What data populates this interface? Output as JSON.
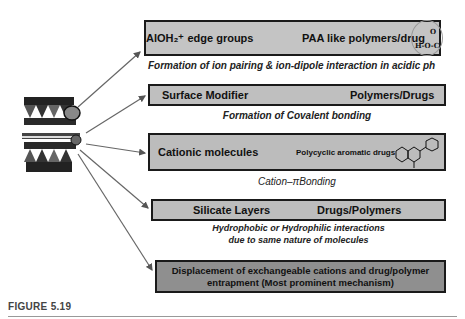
{
  "figure_label": "FIGURE 5.19",
  "clay_structure": {
    "icon": "clay-layer-structure-icon"
  },
  "mechanisms": [
    {
      "left": "AlOH₂⁺ edge groups",
      "right": "PAA like polymers/drug",
      "icon": "carboxylic-acid-group-icon",
      "icon_text": "H-O-C",
      "icon_o": "O",
      "caption": "Formation of ion pairing & ion-dipole interaction in acidic ph"
    },
    {
      "left": "Surface Modifier",
      "right": "Polymers/Drugs",
      "caption": "Formation of Covalent bonding"
    },
    {
      "left": "Cationic molecules",
      "right": "Polycyclic aromatic drugs",
      "icon": "polycyclic-aromatic-structure-icon",
      "caption": "Cation–πBonding"
    },
    {
      "left": "Silicate Layers",
      "right": "Drugs/Polymers",
      "caption_line1": "Hydrophobic  or Hydrophilic interactions",
      "caption_line2": "due to same nature of molecules"
    },
    {
      "line1": "Displacement of exchangeable cations and drug/polymer",
      "line2": "entrapment (Most prominent mechanism)"
    }
  ]
}
